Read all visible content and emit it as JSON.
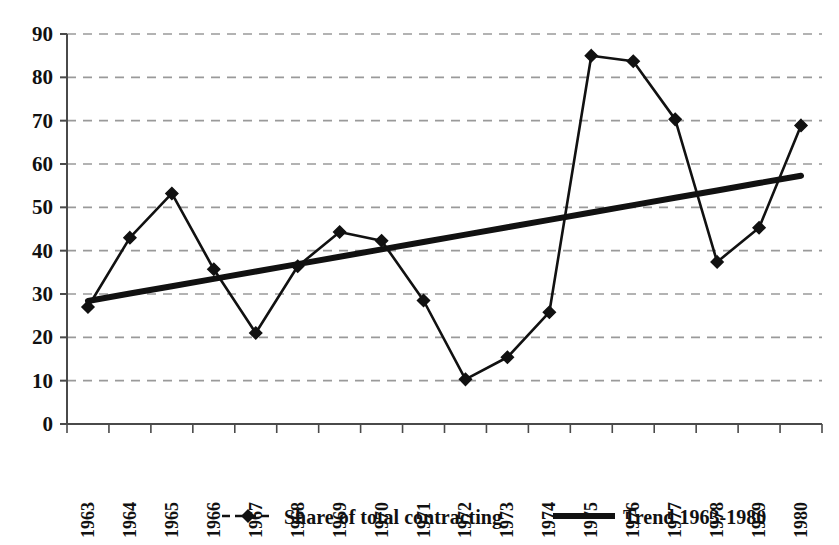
{
  "top_caption": "",
  "chart_data": {
    "type": "line",
    "title": "",
    "xlabel": "",
    "ylabel": "",
    "categories": [
      "1963",
      "1964",
      "1965",
      "1966",
      "1967",
      "1968",
      "1969",
      "1970",
      "1971",
      "1972",
      "1973",
      "1974",
      "1975",
      "1976",
      "1977",
      "1978",
      "1979",
      "1980"
    ],
    "series": [
      {
        "name": "Share of total contracting",
        "marker": "diamond",
        "values": [
          27.0,
          43.0,
          53.2,
          35.7,
          21.0,
          36.4,
          44.3,
          42.3,
          28.5,
          10.3,
          15.4,
          25.8,
          85.0,
          83.7,
          70.3,
          37.4,
          45.3,
          68.9
        ]
      },
      {
        "name": "Trend 1963-1980",
        "marker": "none",
        "values": [
          28.4,
          30.1,
          31.8,
          33.5,
          35.2,
          36.9,
          38.6,
          40.3,
          42.0,
          43.7,
          45.4,
          47.1,
          48.8,
          50.5,
          52.2,
          53.9,
          55.6,
          57.3
        ]
      }
    ],
    "ylim": [
      0,
      90
    ],
    "ytick_values": [
      0,
      10,
      20,
      30,
      40,
      50,
      60,
      70,
      80,
      90
    ],
    "ytick_labels": [
      "0",
      "10",
      "20",
      "30",
      "40",
      "50",
      "60",
      "70",
      "80",
      "90"
    ],
    "grid": "horizontal-dashed",
    "legend_position": "bottom",
    "legend": [
      {
        "label": "Share of total contracting",
        "marker": "diamond-line"
      },
      {
        "label": "Trend 1963-1980",
        "marker": "thick-line"
      }
    ],
    "colors": {
      "series_line": "#111111",
      "trend_line": "#111111",
      "grid": "#9a9a9a",
      "axis": "#4a4a4a",
      "background": "#ffffff"
    }
  }
}
